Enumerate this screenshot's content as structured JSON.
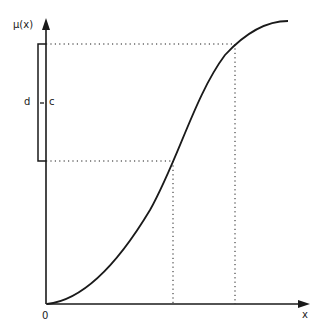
{
  "diagram": {
    "y_axis_label": "μ(x)",
    "x_axis_label": "x",
    "origin_label": "0",
    "bracket_label_outer": "d",
    "bracket_label_inner": "c",
    "colors": {
      "line": "#1a1a1a",
      "background": "#ffffff"
    }
  }
}
